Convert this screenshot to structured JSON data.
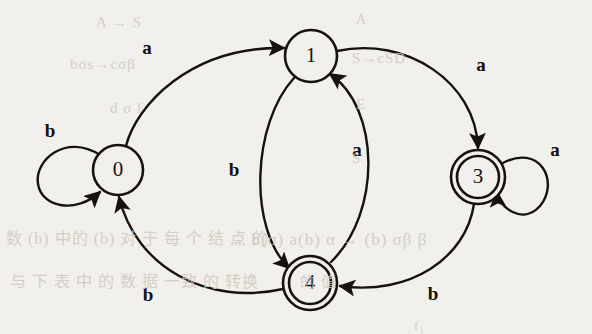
{
  "figure": {
    "background_color": "#f2f0ec",
    "ink_color": "#16130f",
    "states": [
      {
        "id": "0",
        "label": "0",
        "cx": 118,
        "cy": 170,
        "r": 25,
        "accepting": false,
        "start": false
      },
      {
        "id": "1",
        "label": "1",
        "cx": 311,
        "cy": 56,
        "r": 26,
        "accepting": false,
        "start": false
      },
      {
        "id": "3",
        "label": "3",
        "cx": 478,
        "cy": 177,
        "r": 27,
        "accepting": true,
        "start": false
      },
      {
        "id": "4",
        "label": "4",
        "cx": 310,
        "cy": 283,
        "r": 27,
        "accepting": true,
        "start": false
      }
    ],
    "transitions": [
      {
        "from": "0",
        "to": "0",
        "symbol": "b",
        "label_x": 50,
        "label_y": 133
      },
      {
        "from": "0",
        "to": "1",
        "symbol": "a",
        "label_x": 147,
        "label_y": 50
      },
      {
        "from": "1",
        "to": "4",
        "symbol": "b",
        "label_x": 234,
        "label_y": 172
      },
      {
        "from": "4",
        "to": "1",
        "symbol": "a",
        "label_x": 357,
        "label_y": 152
      },
      {
        "from": "1",
        "to": "3",
        "symbol": "a",
        "label_x": 481,
        "label_y": 67
      },
      {
        "from": "3",
        "to": "3",
        "symbol": "a",
        "label_x": 555,
        "label_y": 152
      },
      {
        "from": "3",
        "to": "4",
        "symbol": "b",
        "label_x": 433,
        "label_y": 296
      },
      {
        "from": "4",
        "to": "0",
        "symbol": "b",
        "label_x": 148,
        "label_y": 297
      }
    ],
    "bleed_through_text": [
      {
        "text": "A → S",
        "x": 96,
        "y": 14,
        "size": 15
      },
      {
        "text": "A",
        "x": 356,
        "y": 12,
        "size": 14
      },
      {
        "text": "bσs→cσβ",
        "x": 70,
        "y": 56,
        "size": 15
      },
      {
        "text": "S→cSD",
        "x": 352,
        "y": 50,
        "size": 15
      },
      {
        "text": "d  σ l",
        "x": 110,
        "y": 100,
        "size": 15
      },
      {
        "text": "E",
        "x": 356,
        "y": 96,
        "size": 15
      },
      {
        "text": "S",
        "x": 352,
        "y": 150,
        "size": 15
      },
      {
        "text": "数 (b) 中的 (b) 对 于 每 个 结 点 的",
        "x": 6,
        "y": 225,
        "size": 16
      },
      {
        "text": "→ b(σ) a(b) α → (b) σβ β",
        "x": 228,
        "y": 230,
        "size": 17
      },
      {
        "text": "与 下 表 中 的 数 据 一致 的 转换",
        "x": 10,
        "y": 268,
        "size": 16
      },
      {
        "text": "的 值",
        "x": 300,
        "y": 270,
        "size": 15
      },
      {
        "text": "f₁",
        "x": 414,
        "y": 318,
        "size": 13
      }
    ]
  }
}
